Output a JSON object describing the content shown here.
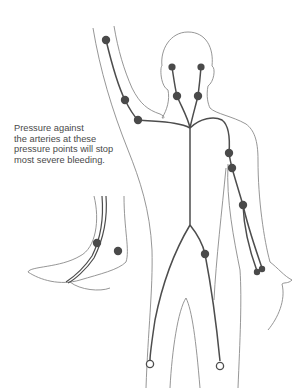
{
  "caption": {
    "lines": [
      "Pressure against",
      "the arteries at these",
      "pressure points will stop",
      "most severe bleeding."
    ]
  },
  "colors": {
    "outline": "#8a8a8a",
    "artery": "#4d4d4d",
    "point": "#4a4a4a",
    "background": "#ffffff"
  },
  "pressure_points": [
    {
      "name": "upper-arm-raised",
      "x": 106,
      "y": 40
    },
    {
      "name": "elbow-raised",
      "x": 125,
      "y": 100
    },
    {
      "name": "axilla-raised",
      "x": 138,
      "y": 120
    },
    {
      "name": "temple-left",
      "x": 172,
      "y": 67
    },
    {
      "name": "temple-right",
      "x": 201,
      "y": 67
    },
    {
      "name": "neck-left",
      "x": 177,
      "y": 96
    },
    {
      "name": "neck-right",
      "x": 198,
      "y": 96
    },
    {
      "name": "upper-arm-right",
      "x": 229,
      "y": 153
    },
    {
      "name": "elbow-right",
      "x": 232,
      "y": 168
    },
    {
      "name": "forearm-right",
      "x": 243,
      "y": 205
    },
    {
      "name": "wrist-right-1",
      "x": 257,
      "y": 271
    },
    {
      "name": "wrist-right-2",
      "x": 262,
      "y": 268
    },
    {
      "name": "femoral",
      "x": 205,
      "y": 254
    },
    {
      "name": "ankle-inner",
      "x": 97,
      "y": 243
    },
    {
      "name": "ankle-outer",
      "x": 118,
      "y": 251
    }
  ],
  "endpoints": [
    {
      "name": "left-leg-end",
      "x": 150,
      "y": 365
    },
    {
      "name": "right-leg-end",
      "x": 220,
      "y": 366
    }
  ]
}
